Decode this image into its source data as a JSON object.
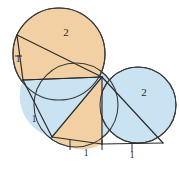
{
  "figure": {
    "background_color": "#ffffff",
    "stroke_color": "#2b2b2b",
    "colors": {
      "tan": "#f2d0a4",
      "blue": "#c9e3f2",
      "outline": "#3a3a3a"
    },
    "circles": [
      {
        "name": "upper-left-circle",
        "cx": 59,
        "cy": 54,
        "r": 46,
        "fill": "tan"
      },
      {
        "name": "lower-middle-circle",
        "cx": 76,
        "cy": 105,
        "r": 42,
        "fill": "blue"
      },
      {
        "name": "right-circle",
        "cx": 138,
        "cy": 105,
        "r": 38,
        "fill": "blue"
      }
    ],
    "labels": [
      {
        "name": "label-top-two",
        "text": "2",
        "x": 66,
        "y": 36
      },
      {
        "name": "label-left-one",
        "text": "1",
        "x": 17,
        "y": 60
      },
      {
        "name": "label-lower-left-one",
        "text": "1",
        "x": 34,
        "y": 120
      },
      {
        "name": "label-bottom-middle-one",
        "text": "1",
        "x": 70,
        "y": 155
      },
      {
        "name": "label-bottom-right-one",
        "text": "1",
        "x": 130,
        "y": 155
      },
      {
        "name": "label-right-two",
        "text": "2",
        "x": 144,
        "y": 95
      }
    ],
    "vertices": {
      "hub": {
        "x": 102,
        "y": 77
      },
      "upper_left_top": {
        "x": 17,
        "y": 35
      },
      "upper_left_bottom": {
        "x": 23,
        "y": 80
      },
      "lower_left_bottom": {
        "x": 52,
        "y": 137
      },
      "bottom_middle": {
        "x": 102,
        "y": 144
      },
      "bottom_right": {
        "x": 163,
        "y": 143
      }
    }
  }
}
